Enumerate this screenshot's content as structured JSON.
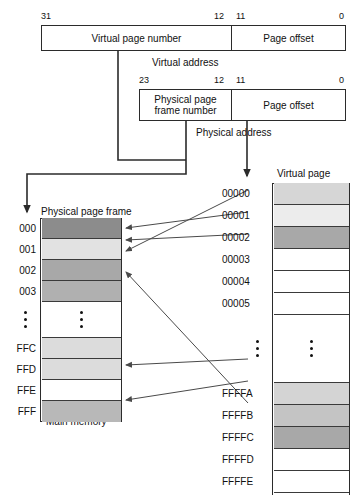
{
  "diagram": {
    "virtual_address": {
      "label": "Virtual address",
      "fields": [
        {
          "name": "Virtual page number",
          "hi": "31",
          "lo": "12"
        },
        {
          "name": "Page offset",
          "hi": "11",
          "lo": "0"
        }
      ]
    },
    "physical_address": {
      "label": "Physical address",
      "fields": [
        {
          "name": "Physical page frame number",
          "name_line1": "Physical page",
          "name_line2": "frame number",
          "hi": "23",
          "lo": "12"
        },
        {
          "name": "Page offset",
          "hi": "11",
          "lo": "0"
        }
      ]
    },
    "physical_memory": {
      "header": "Physical page frame",
      "footer": "Main memory",
      "rows": [
        {
          "label": "000",
          "shade": "#8c8c8c"
        },
        {
          "label": "001",
          "shade": "#e2e2e2"
        },
        {
          "label": "002",
          "shade": "#a8a8a8"
        },
        {
          "label": "003",
          "shade": "#b0b0b0"
        },
        {
          "label": "",
          "shade": "#ffffff"
        },
        {
          "label": "FFC",
          "shade": "#dcdcdc"
        },
        {
          "label": "FFD",
          "shade": "#dcdcdc"
        },
        {
          "label": "FFE",
          "shade": "#ffffff"
        },
        {
          "label": "FFF",
          "shade": "#b8b8b8"
        }
      ],
      "ellipsis": "⋮"
    },
    "virtual_memory": {
      "header": "Virtual page",
      "rows": [
        {
          "label": "00000",
          "shade": "#d6d6d6"
        },
        {
          "label": "00001",
          "shade": "#ececec"
        },
        {
          "label": "00002",
          "shade": "#a8a8a8"
        },
        {
          "label": "00003",
          "shade": "#ffffff"
        },
        {
          "label": "00004",
          "shade": "#ffffff"
        },
        {
          "label": "00005",
          "shade": "#ffffff"
        },
        {
          "label": "",
          "shade": "#ffffff"
        },
        {
          "label": "FFFFA",
          "shade": "#d4d4d4"
        },
        {
          "label": "FFFFB",
          "shade": "#c4c4c4"
        },
        {
          "label": "FFFFC",
          "shade": "#a8a8a8"
        },
        {
          "label": "FFFFD",
          "shade": "#ffffff"
        },
        {
          "label": "FFFFE",
          "shade": "#ffffff"
        },
        {
          "label": "FFFFF",
          "shade": "#ffffff"
        }
      ],
      "ellipsis": "⋮"
    },
    "mappings": [
      {
        "from": "00000",
        "to": "002"
      },
      {
        "from": "00001",
        "to": "000"
      },
      {
        "from": "00002",
        "to": "001"
      },
      {
        "from": "FFFFA",
        "to": "FFD"
      },
      {
        "from": "FFFFB",
        "to": "FFF"
      },
      {
        "from": "FFFFC",
        "to": "003"
      }
    ],
    "colors": {
      "stroke": "#4a4a4a",
      "box_border": "#2b2b2b",
      "text": "#111111",
      "background": "#ffffff"
    }
  }
}
